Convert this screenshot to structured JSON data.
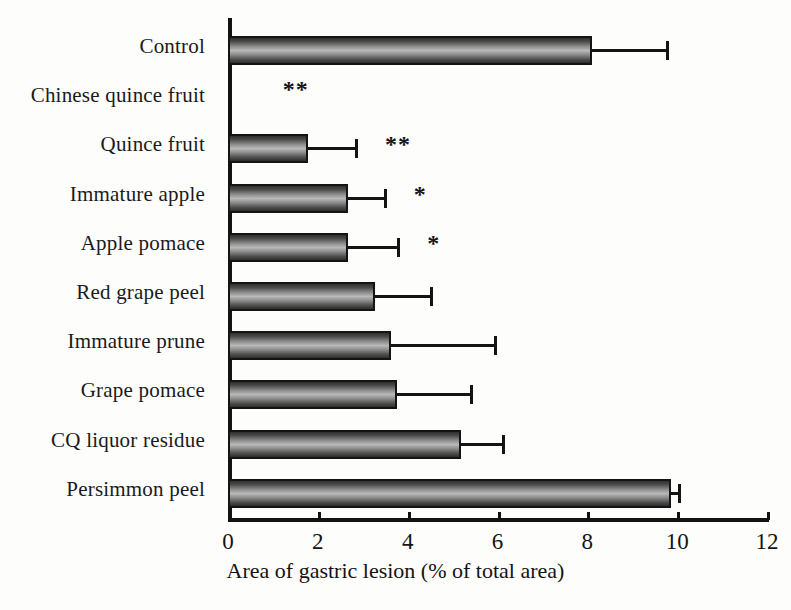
{
  "chart_data": {
    "type": "bar",
    "orientation": "horizontal",
    "title": "",
    "xlabel": "Area of gastric lesion (% of total area)",
    "ylabel": "",
    "xlim": [
      0,
      12
    ],
    "xticks": [
      0,
      2,
      4,
      6,
      8,
      10,
      12
    ],
    "xtick_labels": [
      "0",
      "2",
      "4",
      "6",
      "8",
      "10",
      "12"
    ],
    "grid": false,
    "legend": null,
    "categories": [
      "Control",
      "Chinese quince fruit",
      "Quince fruit",
      "Immature apple",
      "Apple pomace",
      "Red grape peel",
      "Immature prune",
      "Grape pomace",
      "CQ liquor residue",
      "Persimmon peel"
    ],
    "values": [
      8.1,
      0.0,
      1.78,
      2.67,
      2.67,
      3.27,
      3.64,
      3.76,
      5.18,
      9.87
    ],
    "errors": [
      1.65,
      0.0,
      1.05,
      0.8,
      1.1,
      1.22,
      2.29,
      1.62,
      0.93,
      0.15
    ],
    "annotations": [
      "",
      "**",
      "**",
      "*",
      "*",
      "",
      "",
      "",
      "",
      ""
    ],
    "bars": [
      {
        "label": "Control",
        "value": 8.1,
        "error": 1.65,
        "error_upper": 9.75,
        "significance": ""
      },
      {
        "label": "Chinese quince fruit",
        "value": 0.0,
        "error": 0.0,
        "error_upper": 0.0,
        "significance": "**"
      },
      {
        "label": "Quince fruit",
        "value": 1.78,
        "error": 1.05,
        "error_upper": 2.83,
        "significance": "**"
      },
      {
        "label": "Immature apple",
        "value": 2.67,
        "error": 0.8,
        "error_upper": 3.47,
        "significance": "*"
      },
      {
        "label": "Apple pomace",
        "value": 2.67,
        "error": 1.1,
        "error_upper": 3.77,
        "significance": "*"
      },
      {
        "label": "Red grape peel",
        "value": 3.27,
        "error": 1.22,
        "error_upper": 4.49,
        "significance": ""
      },
      {
        "label": "Immature prune",
        "value": 3.64,
        "error": 2.29,
        "error_upper": 5.93,
        "significance": ""
      },
      {
        "label": "Grape pomace",
        "value": 3.76,
        "error": 1.62,
        "error_upper": 5.38,
        "significance": ""
      },
      {
        "label": "CQ liquor residue",
        "value": 5.18,
        "error": 0.93,
        "error_upper": 6.11,
        "significance": ""
      },
      {
        "label": "Persimmon peel",
        "value": 9.87,
        "error": 0.15,
        "error_upper": 10.02,
        "significance": ""
      }
    ],
    "colors": {
      "bar_fill_light": "#b9b9b9",
      "bar_fill_dark": "#2e2e2e",
      "bar_edge": "#141414",
      "axis": "#121212",
      "text": "#141414",
      "background": "#fdfdfc"
    }
  }
}
